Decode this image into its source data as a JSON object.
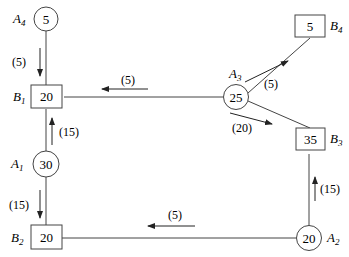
{
  "nodes": {
    "A4": {
      "name": "A",
      "sub": "4",
      "value": "5",
      "shape": "circle"
    },
    "A1": {
      "name": "A",
      "sub": "1",
      "value": "30",
      "shape": "circle"
    },
    "A3": {
      "name": "A",
      "sub": "3",
      "value": "25",
      "shape": "circle"
    },
    "A2": {
      "name": "A",
      "sub": "2",
      "value": "20",
      "shape": "circle"
    },
    "B1": {
      "name": "B",
      "sub": "1",
      "value": "20",
      "shape": "box"
    },
    "B2": {
      "name": "B",
      "sub": "2",
      "value": "20",
      "shape": "box"
    },
    "B3": {
      "name": "B",
      "sub": "3",
      "value": "35",
      "shape": "box"
    },
    "B4": {
      "name": "B",
      "sub": "4",
      "value": "5",
      "shape": "box"
    }
  },
  "flows": [
    {
      "from": "A4",
      "to": "B1",
      "label": "(5)"
    },
    {
      "from": "A1",
      "to": "B1",
      "label": "(15)"
    },
    {
      "from": "A1",
      "to": "B2",
      "label": "(15)"
    },
    {
      "from": "A3",
      "to": "B1",
      "label": "(5)"
    },
    {
      "from": "A3",
      "to": "B4",
      "label": "(5)"
    },
    {
      "from": "A3",
      "to": "B3",
      "label": "(20)"
    },
    {
      "from": "A2",
      "to": "B3",
      "label": "(15)"
    },
    {
      "from": "A2",
      "to": "B2",
      "label": "(5)"
    }
  ]
}
